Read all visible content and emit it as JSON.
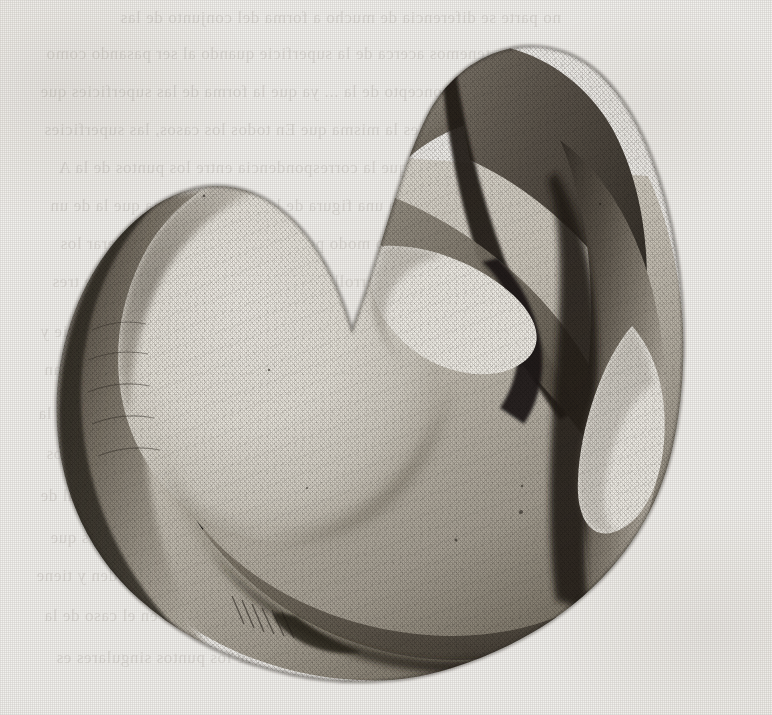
{
  "page": {
    "kind": "scanned-book-plate",
    "paper_color": "#f2f1ee",
    "ink_color": "#2b2620",
    "deepest_shadow_color": "#1a1713",
    "highlight_color": "#eceae4",
    "width": 772,
    "height": 715,
    "has_visible_caption": false,
    "has_visible_page_number": false,
    "has_visible_figure_label": false
  },
  "figure": {
    "name": "self-intersecting-surface-engraving",
    "technique": "line engraving / stipple with cross-hatched shading",
    "features": [
      {
        "id": "dome",
        "label": "large bright dome lobe",
        "region": "upper-left"
      },
      {
        "id": "upper-fold",
        "label": "upper folded flap with dark crease",
        "region": "top-center"
      },
      {
        "id": "pinch-point",
        "label": "central self-intersection pinch point",
        "region": "center"
      },
      {
        "id": "aperture-center",
        "label": "bright teardrop opening",
        "region": "center"
      },
      {
        "id": "aperture-right",
        "label": "bright pear-shaped opening",
        "region": "right"
      },
      {
        "id": "right-column",
        "label": "descending dark fold column",
        "region": "right"
      },
      {
        "id": "lower-rim",
        "label": "lower curved rim with hatched shading",
        "region": "bottom"
      },
      {
        "id": "bottom-cusp",
        "label": "cusp where two rims meet",
        "region": "bottom-center"
      }
    ],
    "tone_stops": [
      "#eeece6",
      "#dedbd3",
      "#c2beb4",
      "#a19c91",
      "#7d776c",
      "#564f46",
      "#332e27",
      "#1d1a15"
    ]
  },
  "show_through": {
    "note": "faint mirror-reversed text bleeding from the reverse side of the leaf; not legible",
    "legible": false,
    "color": "#4a4136",
    "lines": [
      {
        "text": "no parte se diferencia de    mucho a forma del  conjunto de las",
        "x": 120,
        "y": 8,
        "size": 17,
        "ls": 0.6
      },
      {
        "text": "tenemos acerca de la superficie    quando al ser pasando  como",
        "x": 46,
        "y": 44,
        "size": 17,
        "ls": 0.6
      },
      {
        "text": "ver el concepto de la  ... ya que la forma de las superficies que",
        "x": 40,
        "y": 82,
        "size": 17,
        "ls": 0.6
      },
      {
        "text": "segunda es la misma que   En todos los  casos, las superficies",
        "x": 44,
        "y": 120,
        "size": 17,
        "ls": 0.6
      },
      {
        "text": "entiende que la correspondencia entre  los puntos de  la  A",
        "x": 58,
        "y": 158,
        "size": 17,
        "ls": 0.6
      },
      {
        "text": "representa una figura  de la  que  es  la misma  que  la  de  un",
        "x": 50,
        "y": 196,
        "size": 17,
        "ls": 0.6
      },
      {
        "text": "de un mismo modo por  la  cual  se  pueden  considerar  los",
        "x": 60,
        "y": 234,
        "size": 17,
        "ls": 0.6
      },
      {
        "text": "desarrollo de la  superficie  en  el  espacio  de  tres",
        "x": 52,
        "y": 272,
        "size": 17,
        "ls": 0.6
      },
      {
        "text": "y  de  la  misma  manera  los  puntos  de  la  superficie  y",
        "x": 40,
        "y": 322,
        "size": 17,
        "ls": 0.6
      },
      {
        "text": "puntos  de  la  curva  y  las  rectas  que  la  determinan",
        "x": 44,
        "y": 360,
        "size": 17,
        "ls": 0.6
      },
      {
        "text": "correspondencia  biunivoca  entre  los  puntos  de  la",
        "x": 38,
        "y": 404,
        "size": 17,
        "ls": 0.6
      },
      {
        "text": "superficie  de  segundo  orden  que  pasa  por  los",
        "x": 46,
        "y": 444,
        "size": 17,
        "ls": 0.6
      },
      {
        "text": "la  cual  se  obtiene  de  la  ecuacion  general  de",
        "x": 40,
        "y": 486,
        "size": 17,
        "ls": 0.6
      },
      {
        "text": "puntos  de  la  superficie  son  los  mismos  que",
        "x": 50,
        "y": 528,
        "size": 17,
        "ls": 0.6
      },
      {
        "text": "que  la  superficie  es  de  cuarto  orden  y  tiene",
        "x": 36,
        "y": 566,
        "size": 17,
        "ls": 0.6
      },
      {
        "text": "se  ha  dicho  anteriormente  en  el  caso  de  la",
        "x": 44,
        "y": 606,
        "size": 17,
        "ls": 0.6
      },
      {
        "text": "de  los  puntos  singulares  es",
        "x": 56,
        "y": 648,
        "size": 17,
        "ls": 0.6
      }
    ]
  }
}
